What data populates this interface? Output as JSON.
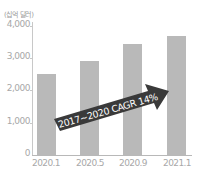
{
  "chart_data": {
    "type": "bar",
    "title": "",
    "unit_label": "(십억 달러)",
    "xlabel": "",
    "ylabel": "(십억 달러)",
    "categories": [
      "2020.1",
      "2020.5",
      "2020.9",
      "2021.1"
    ],
    "values": [
      2500,
      2900,
      3450,
      3700
    ],
    "ylim": [
      0,
      4000
    ],
    "yticks": [
      "0",
      "1,000",
      "2,000",
      "3,000",
      "4,000"
    ],
    "grid": false,
    "legend": null,
    "annotations": [
      {
        "type": "arrow",
        "text": "2017~2020 CAGR 14%",
        "color": "#3a3a3a"
      }
    ],
    "bar_color": "#b9b9b9"
  }
}
